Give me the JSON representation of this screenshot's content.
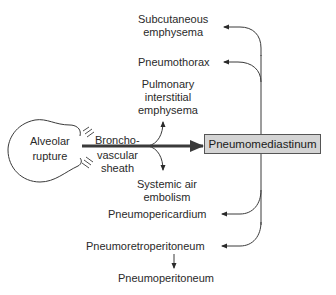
{
  "diagram": {
    "central_node": "Pneumomediastinum",
    "source": {
      "line1": "Alveolar",
      "line2": "rupture"
    },
    "pathway": {
      "line1": "Broncho-",
      "line2": "vascular",
      "line3": "sheath"
    },
    "branch_up": {
      "line1": "Pulmonary",
      "line2": "interstitial",
      "line3": "emphysema"
    },
    "branch_down": {
      "line1": "Systemic air",
      "line2": "embolism"
    },
    "outputs": {
      "subcutaneous": {
        "line1": "Subcutaneous",
        "line2": "emphysema"
      },
      "pneumothorax": "Pneumothorax",
      "pneumopericardium": "Pneumopericardium",
      "pneumoretroperitoneum": "Pneumoretroperitoneum",
      "pneumoperitoneum": "Pneumoperitoneum"
    },
    "colors": {
      "line": "#3a3a3a",
      "box_fill": "#d4d4d4",
      "box_border": "#555555",
      "text": "#2a2a2a"
    }
  }
}
